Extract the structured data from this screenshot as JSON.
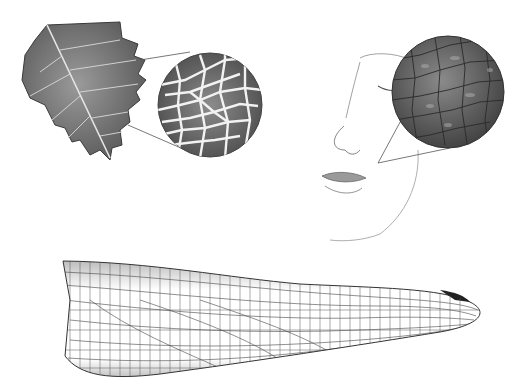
{
  "image": {
    "description": "Pencil illustrations of natural surface textures with magnified detail circles",
    "panels": [
      {
        "subject": "leaf",
        "detail": "magnified leaf vein network"
      },
      {
        "subject": "face",
        "detail": "magnified skin texture"
      },
      {
        "subject": "dragonfly wing",
        "detail": "venation mesh"
      }
    ],
    "colors": {
      "background": "#ffffff",
      "ink": "#3a3a3a",
      "shade": "#8a8a8a",
      "light": "#cfcfcf"
    }
  }
}
